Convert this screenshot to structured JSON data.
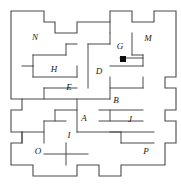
{
  "figure": {
    "type": "polyomino-dissection",
    "canvas": {
      "width": 181,
      "height": 186
    },
    "grid": {
      "origin_x": 11,
      "origin_y": 11,
      "cell": 11,
      "cols": 15,
      "rows": 15
    },
    "stroke_color": "#4a4a4a",
    "background_color": "#ffffff",
    "label_color": "#1a1a1a",
    "marker_color": "#0d0d0d"
  },
  "outline": {
    "name": "outer-boundary",
    "points": "11,11 44,11 44,22 55,22 55,33 77,33 77,22 110,22 110,11 132,11 132,22 154,22 154,11 176,11 176,77 165,77 165,88 176,88 176,110 165,110 165,121 176,121 176,143 165,143 165,165 121,165 121,176 99,176 99,165 77,165 77,176 33,176 33,165 11,165 11,143 22,143 22,132 11,132 11,110 22,110 22,99 11,99"
  },
  "markers": [
    {
      "name": "corner-marker",
      "x": 120,
      "y": 56,
      "size": 6
    }
  ],
  "labels": [
    {
      "id": "A",
      "text": "A",
      "x": 84,
      "y": 119
    },
    {
      "id": "B",
      "text": "B",
      "x": 116,
      "y": 101
    },
    {
      "id": "D",
      "text": "D",
      "x": 99,
      "y": 72
    },
    {
      "id": "E",
      "text": "E",
      "x": 69,
      "y": 88
    },
    {
      "id": "G",
      "text": "G",
      "x": 120,
      "y": 47
    },
    {
      "id": "H",
      "text": "H",
      "x": 54,
      "y": 70
    },
    {
      "id": "I",
      "text": "I",
      "x": 69,
      "y": 136
    },
    {
      "id": "J",
      "text": "J",
      "x": 130,
      "y": 120
    },
    {
      "id": "M",
      "text": "M",
      "x": 148,
      "y": 39
    },
    {
      "id": "N",
      "text": "N",
      "x": 35,
      "y": 38
    },
    {
      "id": "O",
      "text": "O",
      "x": 38,
      "y": 152
    },
    {
      "id": "P",
      "text": "P",
      "x": 146,
      "y": 152
    }
  ],
  "internal_edges": [
    {
      "name": "edge-n-south",
      "points": "33,55 66,55"
    },
    {
      "name": "edge-n-east",
      "points": "66,55 66,44"
    },
    {
      "name": "edge-n-top",
      "points": "66,44 77,44"
    },
    {
      "name": "edge-n-west",
      "points": "33,55 33,66"
    },
    {
      "name": "edge-h-north",
      "points": "33,66 22,66"
    },
    {
      "name": "edge-h-south",
      "points": "33,77 77,77"
    },
    {
      "name": "edge-h-east",
      "points": "77,77 77,66"
    },
    {
      "name": "edge-h-vert",
      "points": "33,66 33,77"
    },
    {
      "name": "edge-d-west",
      "points": "88,44 88,88"
    },
    {
      "name": "edge-d-top",
      "points": "88,44 110,44"
    },
    {
      "name": "edge-d-east",
      "points": "110,44 110,33"
    },
    {
      "name": "edge-g-west",
      "points": "110,33 110,22"
    },
    {
      "name": "edge-g-south",
      "points": "110,66 143,66"
    },
    {
      "name": "edge-g-right",
      "points": "143,66 143,55"
    },
    {
      "name": "edge-g-marker-run",
      "points": "120,58 143,58"
    },
    {
      "name": "edge-m-south",
      "points": "143,55 132,55"
    },
    {
      "name": "edge-m-vert",
      "points": "132,55 132,33"
    },
    {
      "name": "edge-e-south",
      "points": "22,99 110,99"
    },
    {
      "name": "edge-e-top-left",
      "points": "44,88 77,88"
    },
    {
      "name": "edge-e-step",
      "points": "44,88 44,99"
    },
    {
      "name": "edge-b-north",
      "points": "110,88 143,88"
    },
    {
      "name": "edge-b-east",
      "points": "143,88 143,77"
    },
    {
      "name": "edge-b-link",
      "points": "110,77 110,99"
    },
    {
      "name": "edge-b-south",
      "points": "99,110 143,110"
    },
    {
      "name": "edge-a-west",
      "points": "77,99 77,132"
    },
    {
      "name": "edge-a-north-step",
      "points": "55,110 77,110"
    },
    {
      "name": "edge-a-vstep",
      "points": "55,110 55,121"
    },
    {
      "name": "edge-a-south",
      "points": "77,132 121,132"
    },
    {
      "name": "edge-i-north",
      "points": "44,121 66,121"
    },
    {
      "name": "edge-i-vert",
      "points": "44,121 44,143"
    },
    {
      "name": "edge-i-south",
      "points": "44,154 88,154"
    },
    {
      "name": "edge-i-east",
      "points": "66,143 66,165"
    },
    {
      "name": "edge-j-north",
      "points": "110,110 110,121"
    },
    {
      "name": "edge-j-west",
      "points": "99,121 143,121"
    },
    {
      "name": "edge-j-south",
      "points": "110,132 154,132"
    },
    {
      "name": "edge-j-link",
      "points": "121,132 121,143"
    },
    {
      "name": "edge-p-north",
      "points": "121,143 154,143"
    },
    {
      "name": "edge-o-east",
      "points": "22,132 22,143"
    },
    {
      "name": "edge-o-north",
      "points": "22,132 44,132"
    }
  ]
}
